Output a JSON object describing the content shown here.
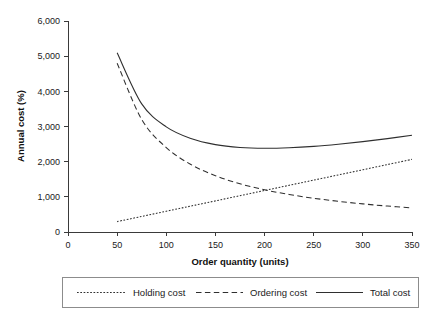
{
  "chart_data": {
    "type": "line",
    "title": "",
    "xlabel": "Order quantity (units)",
    "ylabel": "Annual cost (%)",
    "xlim": [
      0,
      350
    ],
    "ylim": [
      0,
      6000
    ],
    "grid": false,
    "legend_position": "bottom",
    "x_ticks": [
      "0",
      "50",
      "100",
      "150",
      "200",
      "250",
      "300",
      "350"
    ],
    "x_tick_values": [
      0,
      50,
      100,
      150,
      200,
      250,
      300,
      350
    ],
    "y_ticks": [
      "0",
      "1,000",
      "2,000",
      "3,000",
      "4,000",
      "5,000",
      "6,000"
    ],
    "y_tick_values": [
      0,
      1000,
      2000,
      3000,
      4000,
      5000,
      6000
    ],
    "x": [
      50,
      75,
      100,
      125,
      150,
      175,
      200,
      225,
      250,
      275,
      300,
      325,
      350
    ],
    "series": [
      {
        "name": "Holding cost",
        "style": "dotted",
        "values": [
          295,
          443,
          590,
          738,
          885,
          1033,
          1180,
          1328,
          1475,
          1623,
          1770,
          1918,
          2065
        ]
      },
      {
        "name": "Ordering cost",
        "style": "dashed",
        "values": [
          4800,
          3200,
          2400,
          1920,
          1600,
          1371,
          1200,
          1067,
          960,
          873,
          800,
          738,
          686
        ]
      },
      {
        "name": "Total cost",
        "style": "solid",
        "values": [
          5095,
          3643,
          2990,
          2658,
          2485,
          2404,
          2380,
          2395,
          2435,
          2496,
          2570,
          2656,
          2751
        ]
      }
    ]
  },
  "legend": {
    "items": [
      {
        "label": "Holding cost",
        "style": "dotted"
      },
      {
        "label": "Ordering cost",
        "style": "dashed"
      },
      {
        "label": "Total cost",
        "style": "solid"
      }
    ]
  }
}
